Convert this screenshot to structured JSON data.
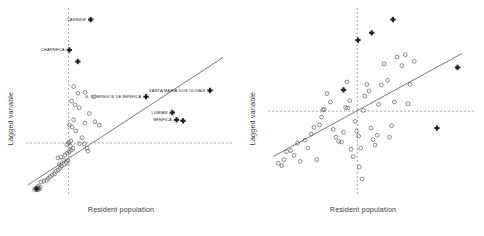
{
  "figure": {
    "title": "",
    "panels": [
      {
        "name": "left-panel",
        "xlabel": "Resident population",
        "ylabel": "Lagged variable"
      },
      {
        "name": "right-panel",
        "xlabel": "Resident population",
        "ylabel": "Lagged variable"
      }
    ]
  },
  "chart_data": [
    {
      "type": "scatter",
      "panel": "left",
      "title": "",
      "xlabel": "Resident population",
      "ylabel": "Lagged variable",
      "xlim": [
        -1.2,
        4.6
      ],
      "ylim": [
        -2.2,
        5.6
      ],
      "grid": false,
      "legend": false,
      "reference_lines": {
        "vertical_x": 0,
        "horizontal_y": 0,
        "style": "dashed"
      },
      "fit_line": {
        "style": "solid",
        "x_start": -1.15,
        "y_start": -1.75,
        "x_end": 4.35,
        "y_end": 3.55
      },
      "series": [
        {
          "name": "unlabelled-observations",
          "marker": "open-circle",
          "points": [
            [
              -0.96,
              -1.93
            ],
            [
              -0.92,
              -1.9
            ],
            [
              -0.88,
              -1.95
            ],
            [
              -0.9,
              -1.86
            ],
            [
              -0.85,
              -1.88
            ],
            [
              -0.83,
              -1.92
            ],
            [
              -0.8,
              -1.84
            ],
            [
              -0.86,
              -1.8
            ],
            [
              -0.78,
              -1.62
            ],
            [
              -0.7,
              -1.58
            ],
            [
              -0.62,
              -1.55
            ],
            [
              -0.58,
              -1.47
            ],
            [
              -0.52,
              -1.4
            ],
            [
              -0.46,
              -1.33
            ],
            [
              -0.4,
              -1.28
            ],
            [
              -0.36,
              -1.18
            ],
            [
              -0.3,
              -1.12
            ],
            [
              -0.24,
              -1.05
            ],
            [
              -0.2,
              -0.96
            ],
            [
              -0.26,
              -0.88
            ],
            [
              -0.12,
              -0.9
            ],
            [
              -0.06,
              -0.82
            ],
            [
              -0.02,
              -0.74
            ],
            [
              -0.14,
              -0.7
            ],
            [
              -0.3,
              -0.62
            ],
            [
              -0.22,
              -0.58
            ],
            [
              -0.1,
              -0.5
            ],
            [
              -0.04,
              -0.42
            ],
            [
              0.02,
              -0.36
            ],
            [
              0.08,
              -0.3
            ],
            [
              0.12,
              -0.22
            ],
            [
              0.05,
              -0.12
            ],
            [
              -0.04,
              -0.06
            ],
            [
              0.0,
              0.02
            ],
            [
              0.06,
              0.08
            ],
            [
              0.3,
              -0.02
            ],
            [
              0.44,
              -0.04
            ],
            [
              0.52,
              -0.22
            ],
            [
              0.54,
              -0.34
            ],
            [
              0.38,
              0.22
            ],
            [
              0.2,
              0.5
            ],
            [
              0.1,
              0.66
            ],
            [
              0.02,
              0.74
            ],
            [
              0.14,
              0.96
            ],
            [
              0.46,
              0.82
            ],
            [
              0.74,
              0.88
            ],
            [
              0.86,
              0.74
            ],
            [
              0.58,
              1.22
            ],
            [
              0.3,
              1.46
            ],
            [
              0.18,
              1.58
            ],
            [
              0.08,
              1.74
            ],
            [
              0.26,
              2.06
            ],
            [
              0.14,
              2.34
            ],
            [
              0.46,
              2.1
            ],
            [
              0.72,
              1.92
            ]
          ]
        },
        {
          "name": "highlighted-parishes",
          "marker": "filled-cross",
          "points": [
            [
              0.62,
              5.12
            ],
            [
              0.02,
              3.86
            ],
            [
              0.26,
              3.38
            ],
            [
              3.98,
              2.18
            ],
            [
              2.18,
              1.92
            ],
            [
              2.92,
              1.26
            ],
            [
              3.22,
              0.92
            ],
            [
              3.04,
              0.96
            ],
            [
              -0.9,
              -1.9
            ]
          ]
        }
      ],
      "annotations": [
        {
          "text": "CARNIDE",
          "x": 0.62,
          "y": 5.12,
          "anchor": "right-of-label"
        },
        {
          "text": "CHARNECA",
          "x": 0.02,
          "y": 3.86,
          "anchor": "right-of-label"
        },
        {
          "text": "SANTA MARIA DOS OLIVAIS",
          "x": 3.98,
          "y": 2.18,
          "anchor": "right-of-label"
        },
        {
          "text": "S. DOMINGOS DE BENFICA",
          "x": 2.18,
          "y": 1.92,
          "anchor": "right-of-label"
        },
        {
          "text": "LUMIAR",
          "x": 2.92,
          "y": 1.26,
          "anchor": "right-of-label"
        },
        {
          "text": "BENFICA",
          "x": 3.04,
          "y": 0.96,
          "anchor": "right-of-label"
        }
      ]
    },
    {
      "type": "scatter",
      "panel": "right",
      "title": "",
      "xlabel": "Resident population",
      "ylabel": "Lagged variable",
      "xlim": [
        -2.6,
        3.4
      ],
      "ylim": [
        -2.8,
        3.4
      ],
      "grid": false,
      "legend": false,
      "reference_lines": {
        "vertical_x": 0,
        "horizontal_y": 0,
        "style": "dashed"
      },
      "fit_line": {
        "style": "solid",
        "x_start": -2.45,
        "y_start": -1.5,
        "x_end": 3.05,
        "y_end": 1.9
      },
      "series": [
        {
          "name": "unlabelled-observations",
          "marker": "open-circle",
          "points": [
            [
              -2.3,
              -1.72
            ],
            [
              -2.2,
              -1.8
            ],
            [
              -2.14,
              -1.6
            ],
            [
              -2.06,
              -1.34
            ],
            [
              -1.94,
              -1.3
            ],
            [
              -1.84,
              -1.46
            ],
            [
              -1.74,
              -1.06
            ],
            [
              -1.66,
              -1.66
            ],
            [
              -1.52,
              -0.96
            ],
            [
              -1.44,
              -1.22
            ],
            [
              -1.34,
              -0.76
            ],
            [
              -1.26,
              -0.54
            ],
            [
              -1.18,
              -1.6
            ],
            [
              -1.1,
              -0.46
            ],
            [
              -1.04,
              -0.2
            ],
            [
              -1.0,
              0.04
            ],
            [
              -0.96,
              0.06
            ],
            [
              -0.88,
              0.58
            ],
            [
              -0.78,
              0.3
            ],
            [
              -0.7,
              -0.6
            ],
            [
              -0.62,
              -0.86
            ],
            [
              -0.54,
              -1.0
            ],
            [
              -0.46,
              -1.02
            ],
            [
              -0.4,
              -0.7
            ],
            [
              -0.34,
              0.12
            ],
            [
              -0.28,
              0.1
            ],
            [
              -0.22,
              0.34
            ],
            [
              -0.3,
              0.96
            ],
            [
              -0.18,
              -1.26
            ],
            [
              -0.12,
              -1.5
            ],
            [
              -0.06,
              -0.34
            ],
            [
              -0.02,
              -0.66
            ],
            [
              0.04,
              -0.82
            ],
            [
              0.1,
              -1.22
            ],
            [
              0.06,
              -1.84
            ],
            [
              0.14,
              -2.24
            ],
            [
              0.18,
              0.02
            ],
            [
              0.22,
              0.5
            ],
            [
              0.28,
              0.88
            ],
            [
              0.34,
              0.66
            ],
            [
              0.4,
              -0.56
            ],
            [
              0.46,
              -0.94
            ],
            [
              0.52,
              -1.12
            ],
            [
              0.58,
              -0.8
            ],
            [
              0.62,
              0.22
            ],
            [
              0.7,
              0.86
            ],
            [
              0.78,
              1.56
            ],
            [
              0.88,
              1.02
            ],
            [
              1.0,
              -0.48
            ],
            [
              1.08,
              0.3
            ],
            [
              1.16,
              1.78
            ],
            [
              1.3,
              1.5
            ],
            [
              1.4,
              1.86
            ],
            [
              1.48,
              0.24
            ],
            [
              1.54,
              0.88
            ],
            [
              1.66,
              1.64
            ],
            [
              0.94,
              -0.86
            ]
          ]
        },
        {
          "name": "highlighted-observations",
          "marker": "filled-cross",
          "points": [
            [
              1.04,
              3.02
            ],
            [
              0.42,
              2.58
            ],
            [
              0.02,
              2.34
            ],
            [
              2.92,
              1.44
            ],
            [
              -0.4,
              0.7
            ],
            [
              2.32,
              -0.56
            ]
          ]
        }
      ],
      "annotations": []
    }
  ]
}
